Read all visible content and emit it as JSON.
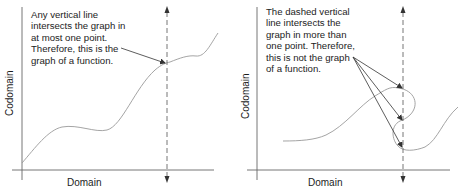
{
  "left_panel": {
    "caption": [
      "Any vertical line",
      "intersects the graph in",
      "at most one point.",
      "Therefore, this is the",
      "graph of a function."
    ],
    "x_axis_label": "Domain",
    "y_axis_label": "Codomain",
    "verdict": "function",
    "intersections": 1
  },
  "right_panel": {
    "caption": [
      "The dashed vertical",
      "line intersects the",
      "graph in more than",
      "one point. Therefore,",
      "this is not the graph",
      "of a function."
    ],
    "x_axis_label": "Domain",
    "y_axis_label": "Codomain",
    "verdict": "not a function",
    "intersections": 3
  },
  "colors": {
    "axis": "#555555",
    "curve": "#9a9a9a",
    "dashed_line": "#555555",
    "arrow": "#333333",
    "text": "#1c1c1c"
  }
}
